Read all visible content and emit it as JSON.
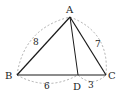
{
  "diagram": {
    "type": "triangle-with-cevian",
    "colors": {
      "line": "#1a1a1a",
      "dashed": "#9a9a9a",
      "text": "#222222",
      "background": "#ffffff"
    },
    "points": {
      "A": {
        "label": "A",
        "x": 70,
        "y": 17
      },
      "B": {
        "label": "B",
        "x": 17,
        "y": 75
      },
      "C": {
        "label": "C",
        "x": 106,
        "y": 75
      },
      "D": {
        "label": "D",
        "x": 78,
        "y": 75
      }
    },
    "segments": [
      {
        "from": "A",
        "to": "B"
      },
      {
        "from": "A",
        "to": "C"
      },
      {
        "from": "B",
        "to": "C"
      },
      {
        "from": "A",
        "to": "D"
      }
    ],
    "lengths": {
      "AB": "8",
      "AC": "7",
      "BD": "6",
      "DC": "3"
    }
  }
}
